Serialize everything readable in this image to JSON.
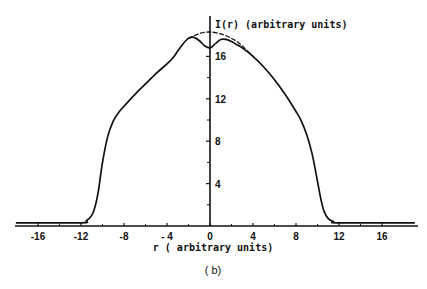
{
  "chart_data": {
    "type": "line",
    "title": "",
    "caption": "( b)",
    "xlabel": "r ( arbitrary units)",
    "ylabel": "I(r) (arbitrary units)",
    "xlim": [
      -18,
      19
    ],
    "ylim": [
      0,
      19
    ],
    "grid": false,
    "legend": null,
    "x_ticks": [
      -16,
      -12,
      -8,
      -4,
      0,
      4,
      8,
      12,
      16
    ],
    "x_tick_labels": [
      "-16",
      "-12",
      "-8",
      "- 4",
      "0",
      "4",
      "8",
      "12",
      "16"
    ],
    "x_minor_ticks": [
      -14,
      -10,
      -6,
      -2,
      2,
      6,
      10,
      14
    ],
    "y_ticks": [
      4,
      8,
      12,
      16
    ],
    "y_tick_labels": [
      "4",
      "8",
      "12",
      "16"
    ],
    "y_minor_ticks": [
      2,
      6,
      10,
      14
    ],
    "series": [
      {
        "name": "measured profile",
        "style": "solid",
        "x": [
          -18,
          -12,
          -11.5,
          -11,
          -10.7,
          -10.4,
          -10,
          -9.5,
          -9,
          -8.5,
          -8,
          -7,
          -6,
          -5,
          -4,
          -3.5,
          -3,
          -2.5,
          -2,
          -1.5,
          -1,
          -0.5,
          0,
          0.5,
          1,
          1.5,
          2,
          2.5,
          3,
          4,
          5,
          6,
          7,
          8,
          8.5,
          9,
          9.5,
          10,
          10.3,
          10.6,
          11,
          11.5,
          12,
          19
        ],
        "values": [
          0.3,
          0.3,
          0.5,
          1.0,
          1.8,
          3.2,
          6.0,
          8.5,
          9.9,
          10.7,
          11.3,
          12.4,
          13.4,
          14.4,
          15.3,
          15.8,
          16.5,
          17.2,
          17.7,
          17.8,
          17.5,
          17.0,
          16.8,
          17.2,
          17.6,
          17.6,
          17.4,
          17.1,
          16.8,
          16.0,
          15.0,
          13.8,
          12.4,
          10.8,
          9.9,
          8.6,
          6.8,
          4.2,
          2.6,
          1.4,
          0.7,
          0.4,
          0.3,
          0.3
        ]
      },
      {
        "name": "extrapolated peak",
        "style": "dashed",
        "x": [
          -2,
          -1.5,
          -1,
          -0.5,
          0,
          0.5,
          1,
          1.5,
          2,
          2.5,
          3,
          3.5,
          4
        ],
        "values": [
          17.7,
          17.95,
          18.15,
          18.28,
          18.3,
          18.25,
          18.12,
          17.95,
          17.7,
          17.4,
          17.0,
          16.5,
          16.0
        ]
      }
    ],
    "baseline_double_line": true
  }
}
